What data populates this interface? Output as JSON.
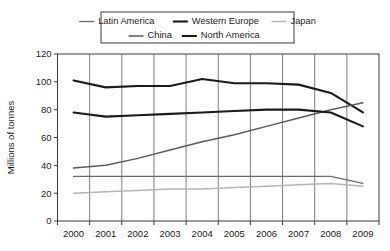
{
  "chart_data": {
    "type": "line",
    "title": "",
    "xlabel": "",
    "ylabel": "Millions of tonnes",
    "x": [
      2000,
      2001,
      2002,
      2003,
      2004,
      2005,
      2006,
      2007,
      2008,
      2009
    ],
    "xtick_labels": [
      "2000",
      "2001",
      "2002",
      "2003",
      "2004",
      "2005",
      "2006",
      "2007",
      "2008",
      "2009"
    ],
    "ytick_labels": [
      "0",
      "20",
      "40",
      "60",
      "80",
      "100",
      "120"
    ],
    "ytick_values": [
      0,
      20,
      40,
      60,
      80,
      100,
      120
    ],
    "ylim": [
      0,
      120
    ],
    "grid": "vertical",
    "legend_position": "top-center",
    "series": [
      {
        "name": "Latin America",
        "color": "#6b6b6b",
        "width": 1.3,
        "values": [
          32,
          32,
          32,
          32,
          32,
          32,
          32,
          32,
          32,
          27
        ]
      },
      {
        "name": "Western Europe",
        "color": "#1a1a1a",
        "width": 2.1,
        "values": [
          101,
          96,
          97,
          97,
          102,
          99,
          99,
          98,
          92,
          78
        ]
      },
      {
        "name": "Japan",
        "color": "#b4b4b4",
        "width": 1.5,
        "values": [
          20,
          21,
          22,
          23,
          23,
          24,
          25,
          26,
          27,
          25
        ]
      },
      {
        "name": "China",
        "color": "#5a5a5a",
        "width": 1.5,
        "values": [
          38,
          40,
          45,
          51,
          57,
          62,
          68,
          74,
          80,
          85
        ]
      },
      {
        "name": "North America",
        "color": "#1a1a1a",
        "width": 2.1,
        "values": [
          78,
          75,
          76,
          77,
          78,
          79,
          80,
          80,
          78,
          68
        ]
      }
    ],
    "legend_rows": [
      [
        "Latin America",
        "Western Europe",
        "Japan"
      ],
      [
        "China",
        "North America"
      ]
    ]
  }
}
